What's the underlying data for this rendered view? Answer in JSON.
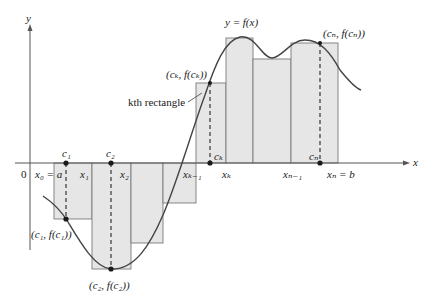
{
  "colors": {
    "rect_fill": "#e6e6e6",
    "rect_stroke": "#7a7a7a",
    "axis": "#555555",
    "curve": "#444444",
    "dashed": "#444444",
    "point": "#1a1a1a",
    "text": "#1a1a1a"
  },
  "axes": {
    "x_label": "x",
    "y_label": "y",
    "origin_label": "0"
  },
  "curve_label": "y = f(x)",
  "partition_labels": [
    {
      "id": "x0",
      "text": "x₀ = a"
    },
    {
      "id": "x1",
      "text": "x₁"
    },
    {
      "id": "x2",
      "text": "x₂"
    },
    {
      "id": "xk-1",
      "text": "xₖ₋₁"
    },
    {
      "id": "xk",
      "text": "xₖ"
    },
    {
      "id": "xn-1",
      "text": "xₙ₋₁"
    },
    {
      "id": "xn",
      "text": "xₙ = b"
    }
  ],
  "sample_points": [
    {
      "id": "c1",
      "label": "c₁",
      "point_label": "(c₁, f(c₁))"
    },
    {
      "id": "c2",
      "label": "c₂",
      "point_label": "(c₂, f(c₂))"
    },
    {
      "id": "ck",
      "label": "cₖ",
      "point_label": "(cₖ, f(cₖ))"
    },
    {
      "id": "cn",
      "label": "cₙ",
      "point_label": "(cₙ, f(cₙ))"
    }
  ],
  "annotation": {
    "kth_rectangle": "kth rectangle"
  },
  "rectangles": [
    {
      "x0": 54,
      "x1": 92,
      "top": 163,
      "bottom": 219
    },
    {
      "x0": 92,
      "x1": 131,
      "top": 163,
      "bottom": 269
    },
    {
      "x0": 131,
      "x1": 163,
      "top": 163,
      "bottom": 243
    },
    {
      "x0": 163,
      "x1": 196,
      "top": 163,
      "bottom": 203
    },
    {
      "x0": 196,
      "x1": 226,
      "top": 83,
      "bottom": 163
    },
    {
      "x0": 226,
      "x1": 253,
      "top": 38,
      "bottom": 163
    },
    {
      "x0": 253,
      "x1": 291,
      "top": 59,
      "bottom": 163
    },
    {
      "x0": 291,
      "x1": 338,
      "top": 43,
      "bottom": 163
    }
  ]
}
